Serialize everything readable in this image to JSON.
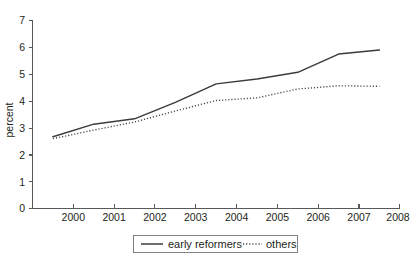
{
  "chart_data": {
    "type": "line",
    "title": "",
    "xlabel": "",
    "ylabel": "percent",
    "xlim": [
      1999,
      2008
    ],
    "ylim": [
      0,
      7
    ],
    "xticks": [
      "2000",
      "2001",
      "2002",
      "2003",
      "2004",
      "2005",
      "2006",
      "2007",
      "2008"
    ],
    "yticks": [
      "0",
      "1",
      "2",
      "3",
      "4",
      "5",
      "6",
      "7"
    ],
    "grid": false,
    "legend_position": "bottom-center",
    "x": [
      1999.5,
      2000.5,
      2001.5,
      2002.5,
      2003.5,
      2004.5,
      2005.5,
      2006.5,
      2007.5
    ],
    "series": [
      {
        "name": "early reformers",
        "style": "solid",
        "color": "#3b3b3f",
        "values": [
          2.67,
          3.14,
          3.34,
          3.95,
          4.64,
          4.82,
          5.07,
          5.75,
          5.9
        ]
      },
      {
        "name": "others",
        "style": "dotted",
        "color": "#4a4a4e",
        "values": [
          2.6,
          2.92,
          3.22,
          3.63,
          4.02,
          4.12,
          4.45,
          4.57,
          4.55
        ]
      }
    ]
  },
  "axes": {
    "y_axis_title": "percent",
    "y_tick_labels": [
      "7",
      "6",
      "5",
      "4",
      "3",
      "2",
      "1",
      "0"
    ],
    "x_tick_labels": [
      "2000",
      "2001",
      "2002",
      "2003",
      "2004",
      "2005",
      "2006",
      "2007",
      "2008"
    ]
  },
  "legend": {
    "entries": [
      {
        "label": "early reformers",
        "style": "solid"
      },
      {
        "label": "others",
        "style": "dotted"
      }
    ]
  }
}
